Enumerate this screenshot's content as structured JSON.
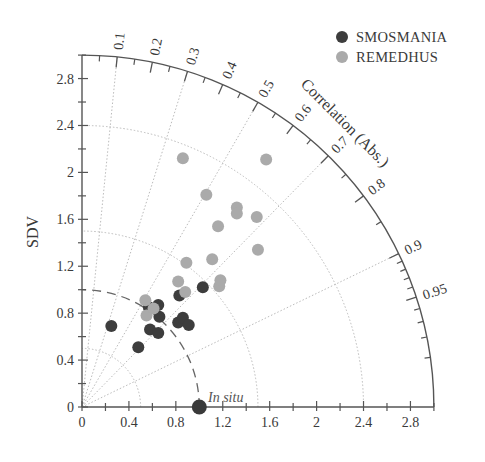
{
  "chart_data": {
    "type": "taylor-diagram",
    "title": "",
    "xlabel": "",
    "ylabel": "SDV",
    "angular_label": "Correlation (Abs.)",
    "axis_range": {
      "sdv_max": 3.0
    },
    "x_ticks": [
      "0",
      "0.4",
      "0.8",
      "1.2",
      "1.6",
      "2",
      "2.4",
      "2.8"
    ],
    "y_ticks": [
      "0",
      "0.4",
      "0.8",
      "1.2",
      "1.6",
      "2",
      "2.4",
      "2.8"
    ],
    "tick_values": [
      0,
      0.4,
      0.8,
      1.2,
      1.6,
      2.0,
      2.4,
      2.8
    ],
    "correlation_ticks": [
      {
        "value": 0.1,
        "label": "0.1"
      },
      {
        "value": 0.2,
        "label": "0.2"
      },
      {
        "value": 0.3,
        "label": "0.3"
      },
      {
        "value": 0.4,
        "label": "0.4"
      },
      {
        "value": 0.5,
        "label": "0.5"
      },
      {
        "value": 0.6,
        "label": "0.6"
      },
      {
        "value": 0.7,
        "label": "0.7"
      },
      {
        "value": 0.8,
        "label": "0.8"
      },
      {
        "value": 0.9,
        "label": "0.9"
      },
      {
        "value": 0.95,
        "label": "0.95"
      }
    ],
    "correlation_minor_ticks": [
      0.05,
      0.15,
      0.25,
      0.35,
      0.45,
      0.55,
      0.65,
      0.75,
      0.85,
      0.91,
      0.92,
      0.93,
      0.94,
      0.96,
      0.97,
      0.98,
      0.99
    ],
    "correlation_gridlines": [
      0.1,
      0.3,
      0.5,
      0.7,
      0.9
    ],
    "sdv_arcs": [
      0.5,
      1.5,
      2.4
    ],
    "reference": {
      "label": "In situ",
      "sdv": 1.0,
      "dashed_arc_radius": 1.0,
      "color": "#3a3a3a"
    },
    "grid": true,
    "legend_position": "top-right",
    "series": [
      {
        "name": "SMOSMANIA",
        "color": "#3d3d3d",
        "points": [
          [
            0.25,
            0.69
          ],
          [
            0.48,
            0.51
          ],
          [
            0.58,
            0.66
          ],
          [
            0.65,
            0.63
          ],
          [
            0.66,
            0.77
          ],
          [
            0.65,
            0.87
          ],
          [
            0.57,
            0.85
          ],
          [
            0.82,
            0.72
          ],
          [
            0.86,
            0.76
          ],
          [
            0.91,
            0.7
          ],
          [
            0.83,
            0.95
          ],
          [
            1.03,
            1.02
          ]
        ]
      },
      {
        "name": "REMEDHUS",
        "color": "#aaaaaa",
        "points": [
          [
            0.54,
            0.91
          ],
          [
            0.55,
            0.78
          ],
          [
            0.61,
            0.84
          ],
          [
            0.88,
            0.98
          ],
          [
            0.82,
            1.07
          ],
          [
            1.17,
            1.03
          ],
          [
            1.18,
            1.08
          ],
          [
            0.89,
            1.23
          ],
          [
            1.11,
            1.26
          ],
          [
            1.5,
            1.34
          ],
          [
            1.16,
            1.54
          ],
          [
            1.49,
            1.62
          ],
          [
            1.32,
            1.7
          ],
          [
            1.32,
            1.65
          ],
          [
            1.06,
            1.81
          ],
          [
            0.86,
            2.12
          ],
          [
            1.57,
            2.11
          ]
        ]
      }
    ]
  },
  "legend": {
    "items": [
      {
        "label": "SMOSMANIA",
        "color": "#3d3d3d"
      },
      {
        "label": "REMEDHUS",
        "color": "#aaaaaa"
      }
    ]
  },
  "labels": {
    "ylabel": "SDV",
    "angular_label": "Correlation (Abs.)",
    "reference": "In situ"
  }
}
